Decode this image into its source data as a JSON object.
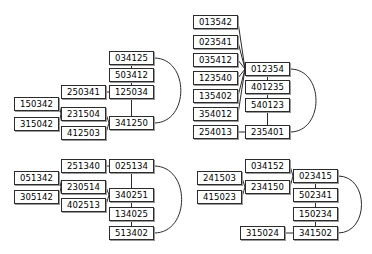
{
  "diagram": {
    "type": "graph-clusters",
    "node_width": 45,
    "node_height": 14,
    "clusters": [
      {
        "id": "cluster-top-left",
        "name": "top-left-cluster",
        "nodes": [
          {
            "id": "tl1",
            "label": "034125",
            "x": 109,
            "y": 51
          },
          {
            "id": "tl2",
            "label": "503412",
            "x": 109,
            "y": 68
          },
          {
            "id": "tl3",
            "label": "125034",
            "x": 109,
            "y": 85
          },
          {
            "id": "tl4",
            "label": "250341",
            "x": 61,
            "y": 85
          },
          {
            "id": "tl5",
            "label": "150342",
            "x": 14,
            "y": 97
          },
          {
            "id": "tl6",
            "label": "231504",
            "x": 61,
            "y": 107
          },
          {
            "id": "tl7",
            "label": "315042",
            "x": 14,
            "y": 117
          },
          {
            "id": "tl8",
            "label": "341250",
            "x": 109,
            "y": 116
          },
          {
            "id": "tl9",
            "label": "412503",
            "x": 61,
            "y": 126
          }
        ],
        "edges": [
          {
            "from": "tl1",
            "to": "tl2",
            "shape": "line"
          },
          {
            "from": "tl2",
            "to": "tl3",
            "shape": "line"
          },
          {
            "from": "tl4",
            "to": "tl3",
            "shape": "line"
          },
          {
            "from": "tl3",
            "to": "tl8",
            "shape": "line"
          },
          {
            "from": "tl5",
            "to": "tl6",
            "shape": "line"
          },
          {
            "from": "tl7",
            "to": "tl6",
            "shape": "line"
          },
          {
            "from": "tl6",
            "to": "tl8",
            "shape": "line"
          },
          {
            "from": "tl9",
            "to": "tl8",
            "shape": "line"
          },
          {
            "from": "tl1",
            "to": "tl8",
            "shape": "arc-right"
          }
        ]
      },
      {
        "id": "cluster-top-right",
        "name": "top-right-cluster",
        "nodes": [
          {
            "id": "tr1",
            "label": "013542",
            "x": 193,
            "y": 15
          },
          {
            "id": "tr2",
            "label": "023541",
            "x": 193,
            "y": 35
          },
          {
            "id": "tr3",
            "label": "035412",
            "x": 193,
            "y": 53
          },
          {
            "id": "tr4",
            "label": "012354",
            "x": 245,
            "y": 62
          },
          {
            "id": "tr5",
            "label": "123540",
            "x": 193,
            "y": 71
          },
          {
            "id": "tr6",
            "label": "401235",
            "x": 245,
            "y": 80
          },
          {
            "id": "tr7",
            "label": "135402",
            "x": 193,
            "y": 89
          },
          {
            "id": "tr8",
            "label": "540123",
            "x": 245,
            "y": 98
          },
          {
            "id": "tr9",
            "label": "354012",
            "x": 193,
            "y": 107
          },
          {
            "id": "tr10",
            "label": "254013",
            "x": 193,
            "y": 125
          },
          {
            "id": "tr11",
            "label": "235401",
            "x": 245,
            "y": 125
          }
        ],
        "edges": [
          {
            "from": "tr1",
            "to": "tr4",
            "shape": "line"
          },
          {
            "from": "tr2",
            "to": "tr4",
            "shape": "line"
          },
          {
            "from": "tr3",
            "to": "tr4",
            "shape": "line"
          },
          {
            "from": "tr5",
            "to": "tr4",
            "shape": "line"
          },
          {
            "from": "tr7",
            "to": "tr4",
            "shape": "line"
          },
          {
            "from": "tr9",
            "to": "tr4",
            "shape": "line"
          },
          {
            "from": "tr4",
            "to": "tr6",
            "shape": "line"
          },
          {
            "from": "tr6",
            "to": "tr8",
            "shape": "line"
          },
          {
            "from": "tr8",
            "to": "tr11",
            "shape": "line"
          },
          {
            "from": "tr10",
            "to": "tr11",
            "shape": "line"
          },
          {
            "from": "tr4",
            "to": "tr11",
            "shape": "arc-right"
          }
        ]
      },
      {
        "id": "cluster-bottom-left",
        "name": "bottom-left-cluster",
        "nodes": [
          {
            "id": "bl1",
            "label": "251340",
            "x": 61,
            "y": 159
          },
          {
            "id": "bl2",
            "label": "025134",
            "x": 109,
            "y": 159
          },
          {
            "id": "bl3",
            "label": "051342",
            "x": 14,
            "y": 171
          },
          {
            "id": "bl4",
            "label": "230514",
            "x": 61,
            "y": 180
          },
          {
            "id": "bl5",
            "label": "305142",
            "x": 14,
            "y": 190
          },
          {
            "id": "bl6",
            "label": "340251",
            "x": 109,
            "y": 188
          },
          {
            "id": "bl7",
            "label": "402513",
            "x": 61,
            "y": 198
          },
          {
            "id": "bl8",
            "label": "134025",
            "x": 109,
            "y": 207
          },
          {
            "id": "bl9",
            "label": "513402",
            "x": 109,
            "y": 226
          }
        ],
        "edges": [
          {
            "from": "bl1",
            "to": "bl2",
            "shape": "line"
          },
          {
            "from": "bl2",
            "to": "bl6",
            "shape": "line"
          },
          {
            "from": "bl3",
            "to": "bl4",
            "shape": "line"
          },
          {
            "from": "bl5",
            "to": "bl4",
            "shape": "line"
          },
          {
            "from": "bl4",
            "to": "bl6",
            "shape": "line"
          },
          {
            "from": "bl7",
            "to": "bl6",
            "shape": "line"
          },
          {
            "from": "bl6",
            "to": "bl8",
            "shape": "line"
          },
          {
            "from": "bl8",
            "to": "bl9",
            "shape": "line"
          },
          {
            "from": "bl2",
            "to": "bl9",
            "shape": "arc-right"
          }
        ]
      },
      {
        "id": "cluster-bottom-right",
        "name": "bottom-right-cluster",
        "nodes": [
          {
            "id": "br1",
            "label": "034152",
            "x": 245,
            "y": 159
          },
          {
            "id": "br2",
            "label": "023415",
            "x": 293,
            "y": 169
          },
          {
            "id": "br3",
            "label": "241503",
            "x": 197,
            "y": 171
          },
          {
            "id": "br4",
            "label": "234150",
            "x": 245,
            "y": 180
          },
          {
            "id": "br5",
            "label": "415023",
            "x": 197,
            "y": 190
          },
          {
            "id": "br6",
            "label": "502341",
            "x": 293,
            "y": 188
          },
          {
            "id": "br7",
            "label": "150234",
            "x": 293,
            "y": 207
          },
          {
            "id": "br8",
            "label": "315024",
            "x": 240,
            "y": 226
          },
          {
            "id": "br9",
            "label": "341502",
            "x": 293,
            "y": 226
          }
        ],
        "edges": [
          {
            "from": "br1",
            "to": "br2",
            "shape": "line"
          },
          {
            "from": "br3",
            "to": "br4",
            "shape": "line"
          },
          {
            "from": "br5",
            "to": "br4",
            "shape": "line"
          },
          {
            "from": "br4",
            "to": "br2",
            "shape": "line"
          },
          {
            "from": "br2",
            "to": "br6",
            "shape": "line"
          },
          {
            "from": "br6",
            "to": "br7",
            "shape": "line"
          },
          {
            "from": "br7",
            "to": "br9",
            "shape": "line"
          },
          {
            "from": "br8",
            "to": "br9",
            "shape": "line"
          },
          {
            "from": "br2",
            "to": "br9",
            "shape": "arc-right"
          }
        ]
      }
    ]
  },
  "style": {
    "edge_color": "#2b2b2b",
    "node_border_color": "#2b2b2b",
    "node_shadow_color": "#9a9a9a",
    "node_fill": "#ffffff",
    "text_color": "#000000",
    "background": "#ffffff"
  }
}
